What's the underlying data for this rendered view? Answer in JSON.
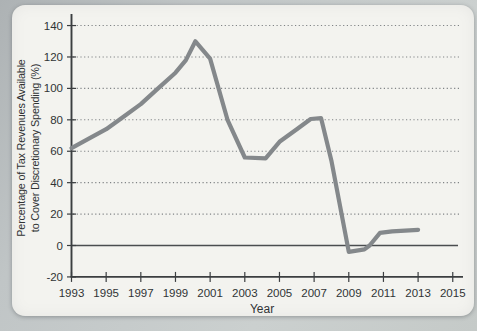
{
  "chart_data": {
    "type": "line",
    "title": "",
    "xlabel": "Year",
    "ylabel": "Percentage of Tax Revenues Available to Cover Discretionary Spending (%)",
    "ylabel_line1": "Percentage of Tax Revenues Available",
    "ylabel_line2": "to Cover Discretionary Spending (%)",
    "xlim": [
      1993,
      2015
    ],
    "ylim": [
      -20,
      140
    ],
    "x_ticks": [
      1993,
      1995,
      1997,
      1999,
      2001,
      2003,
      2005,
      2007,
      2009,
      2011,
      2013,
      2015
    ],
    "y_ticks": [
      140,
      120,
      100,
      80,
      60,
      40,
      20,
      0,
      -20
    ],
    "grid": "horizontal-dotted",
    "legend": "none",
    "series": [
      {
        "points": [
          [
            1993,
            62
          ],
          [
            1994,
            68
          ],
          [
            1995,
            74
          ],
          [
            1996,
            82
          ],
          [
            1997,
            90
          ],
          [
            1998,
            100
          ],
          [
            1999,
            110
          ],
          [
            1999.6,
            118
          ],
          [
            2000.15,
            130
          ],
          [
            2001,
            119
          ],
          [
            2002,
            80
          ],
          [
            2003,
            56
          ],
          [
            2004.2,
            55.5
          ],
          [
            2005,
            66
          ],
          [
            2006,
            74
          ],
          [
            2006.8,
            80.5
          ],
          [
            2007.4,
            81
          ],
          [
            2008,
            54
          ],
          [
            2009,
            -4
          ],
          [
            2009.9,
            -2.5
          ],
          [
            2010.2,
            0
          ],
          [
            2010.8,
            8
          ],
          [
            2011.5,
            9
          ],
          [
            2013,
            10
          ]
        ]
      }
    ],
    "colors": {
      "line": "#84888b",
      "axis": "#3b3e40",
      "grid": "#808486",
      "zero_line": "#4a4d4f",
      "text": "#303335",
      "panel": "#f3f3ef",
      "page": "#c0c5c6"
    }
  }
}
